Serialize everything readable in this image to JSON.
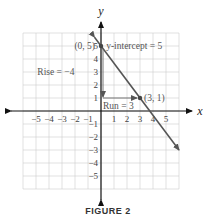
{
  "caption": "FIGURE 2",
  "chart_data": {
    "type": "line",
    "title": "FIGURE 2",
    "xlabel": "x",
    "ylabel": "y",
    "xlim": [
      -6,
      6
    ],
    "ylim": [
      -6,
      6
    ],
    "grid": true,
    "x_ticks": [
      -5,
      -4,
      -3,
      -2,
      -1,
      1,
      2,
      3,
      4,
      5
    ],
    "y_ticks": [
      -5,
      -4,
      -3,
      -2,
      -1,
      1,
      2,
      3,
      4,
      5
    ],
    "series": [
      {
        "name": "line",
        "equation": "y = -4/3 x + 5",
        "slope": -1.3333,
        "intercept": 5,
        "x": [
          -0.5,
          6
        ],
        "y": [
          5.67,
          -3
        ]
      }
    ],
    "points": [
      {
        "label": "(0, 5)",
        "x": 0,
        "y": 5
      },
      {
        "label": "(3, 1)",
        "x": 3,
        "y": 1
      }
    ],
    "annotations": [
      {
        "text": "y-intercept = 5",
        "x": 0.3,
        "y": 5
      },
      {
        "text": "Rise = −4",
        "x": -4.9,
        "y": 3
      },
      {
        "text": "Run = 3",
        "x": 0.2,
        "y": 0.5
      }
    ],
    "colors": {
      "line": "#555555",
      "axis": "#111111",
      "grid": "#cccccc"
    }
  }
}
